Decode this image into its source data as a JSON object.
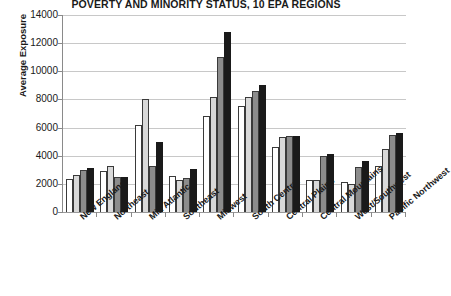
{
  "chart_data": {
    "type": "bar",
    "title": "POVERTY AND MINORITY STATUS, 10 EPA REGIONS",
    "xlabel": "",
    "ylabel": "Average Exposure",
    "ylim": [
      0,
      14000
    ],
    "ytick_values": [
      14000,
      12000,
      10000,
      8000,
      6000,
      4000,
      2000,
      0
    ],
    "ytick_labels": [
      "14000",
      "12000",
      "10000",
      "8000",
      "6000",
      "4000",
      "2000",
      "0"
    ],
    "grid": true,
    "legend": "none",
    "categories": [
      "New England",
      "Northeast",
      "Mid Atlantic",
      "Southeast",
      "Midwest",
      "South Central",
      "Central Plains",
      "Central Mountains",
      "West/Southwest",
      "Pacific Northwest"
    ],
    "series": [
      {
        "name": "series-1",
        "color": "#ffffff",
        "values": [
          2350,
          2950,
          6200,
          2550,
          6800,
          7500,
          4650,
          2300,
          2100,
          3300
        ]
      },
      {
        "name": "series-2",
        "color": "#d9d9d9",
        "values": [
          2600,
          3300,
          8000,
          2300,
          8200,
          8200,
          5350,
          2300,
          2000,
          4500
        ]
      },
      {
        "name": "series-3",
        "color": "#8c8c8c",
        "values": [
          3000,
          2500,
          3300,
          2400,
          11000,
          8600,
          5400,
          4000,
          3200,
          5500
        ]
      },
      {
        "name": "series-4",
        "color": "#1a1a1a",
        "values": [
          3150,
          2500,
          5000,
          3050,
          12800,
          9000,
          5400,
          4100,
          3600,
          5600
        ]
      }
    ]
  }
}
